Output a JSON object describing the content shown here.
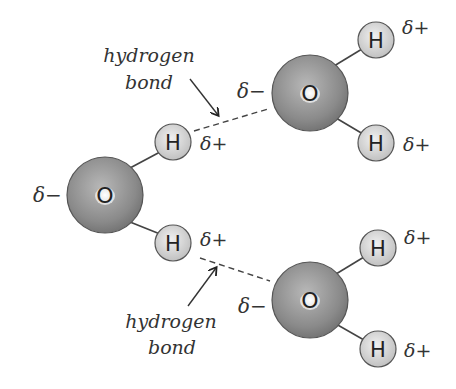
{
  "diagram": {
    "colors": {
      "oxygen": "#8c8c8c",
      "hydrogen": "#d6d6d6",
      "outline": "#555555",
      "text": "#333333"
    },
    "molecules": [
      {
        "id": "left",
        "oxygen": {
          "label": "O",
          "charge": "δ−",
          "cx": 105,
          "cy": 195
        },
        "hydrogens": [
          {
            "label": "H",
            "charge": "δ+",
            "cx": 173,
            "cy": 142
          },
          {
            "label": "H",
            "charge": "δ+",
            "cx": 173,
            "cy": 243
          }
        ]
      },
      {
        "id": "top-right",
        "oxygen": {
          "label": "O",
          "charge": "δ−",
          "cx": 310,
          "cy": 93
        },
        "hydrogens": [
          {
            "label": "H",
            "charge": "δ+",
            "cx": 376,
            "cy": 40
          },
          {
            "label": "H",
            "charge": "δ+",
            "cx": 376,
            "cy": 143
          }
        ]
      },
      {
        "id": "bottom-right",
        "oxygen": {
          "label": "O",
          "charge": "δ−",
          "cx": 310,
          "cy": 300
        },
        "hydrogens": [
          {
            "label": "H",
            "charge": "δ+",
            "cx": 378,
            "cy": 248
          },
          {
            "label": "H",
            "charge": "δ+",
            "cx": 378,
            "cy": 349
          }
        ]
      }
    ],
    "annotations": [
      {
        "line1": "hydrogen",
        "line2": "bond",
        "position": "top"
      },
      {
        "line1": "hydrogen",
        "line2": "bond",
        "position": "bottom"
      }
    ]
  }
}
